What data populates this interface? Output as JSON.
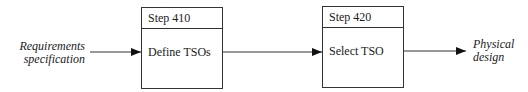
{
  "diagram": {
    "input_label": [
      "Requirements",
      "specification"
    ],
    "output_label": [
      "Physical",
      "design"
    ],
    "steps": [
      {
        "step": "Step 410",
        "action": "Define TSOs"
      },
      {
        "step": "Step 420",
        "action": "Select TSO"
      }
    ],
    "colors": {
      "line": "#333333",
      "text": "#1a1a1a"
    }
  }
}
